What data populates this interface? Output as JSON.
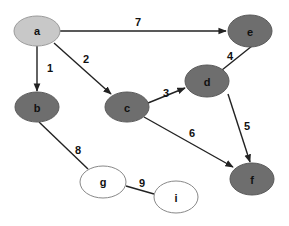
{
  "colors": {
    "source": "#c8c8c8",
    "visited": "#6e6e6e",
    "unvisited": "#ffffff",
    "edge": "#222222",
    "outline": "#888888"
  },
  "nodes": [
    {
      "id": "a",
      "label": "a",
      "x": 37,
      "y": 31,
      "state": "source"
    },
    {
      "id": "b",
      "label": "b",
      "x": 37,
      "y": 107,
      "state": "visited"
    },
    {
      "id": "c",
      "label": "c",
      "x": 127,
      "y": 107,
      "state": "visited"
    },
    {
      "id": "d",
      "label": "d",
      "x": 207,
      "y": 81,
      "state": "visited"
    },
    {
      "id": "e",
      "label": "e",
      "x": 250,
      "y": 31,
      "state": "visited"
    },
    {
      "id": "f",
      "label": "f",
      "x": 252,
      "y": 179,
      "state": "visited"
    },
    {
      "id": "g",
      "label": "g",
      "x": 103,
      "y": 182,
      "state": "unvisited"
    },
    {
      "id": "i",
      "label": "i",
      "x": 176,
      "y": 197,
      "state": "unvisited"
    }
  ],
  "edges": [
    {
      "from": "a",
      "to": "b",
      "label": "1",
      "directed": true
    },
    {
      "from": "a",
      "to": "c",
      "label": "2",
      "directed": true
    },
    {
      "from": "c",
      "to": "d",
      "label": "3",
      "directed": true
    },
    {
      "from": "e",
      "to": "d",
      "label": "4",
      "directed": false
    },
    {
      "from": "d",
      "to": "f",
      "label": "5",
      "directed": true
    },
    {
      "from": "c",
      "to": "f",
      "label": "6",
      "directed": true
    },
    {
      "from": "a",
      "to": "e",
      "label": "7",
      "directed": true
    },
    {
      "from": "b",
      "to": "g",
      "label": "8",
      "directed": false
    },
    {
      "from": "g",
      "to": "i",
      "label": "9",
      "directed": false
    }
  ],
  "edge_labels": {
    "1": "1",
    "2": "2",
    "3": "3",
    "4": "4",
    "5": "5",
    "6": "6",
    "7": "7",
    "8": "8",
    "9": "9"
  },
  "node_labels": {
    "a": "a",
    "b": "b",
    "c": "c",
    "d": "d",
    "e": "e",
    "f": "f",
    "g": "g",
    "i": "i"
  }
}
